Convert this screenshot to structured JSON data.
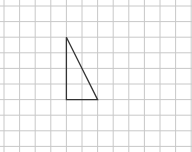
{
  "diagram": {
    "type": "grid-with-triangle",
    "grid": {
      "cell_size": 15.6,
      "origin_x": 4,
      "origin_y": 6,
      "columns": 12,
      "rows": 9,
      "line_color": "#c8c8c8"
    },
    "triangle": {
      "vertices_grid": [
        [
          4,
          2
        ],
        [
          4,
          6
        ],
        [
          6,
          6
        ]
      ],
      "stroke_color": "#333333",
      "right_angle_at": [
        4,
        6
      ]
    }
  }
}
